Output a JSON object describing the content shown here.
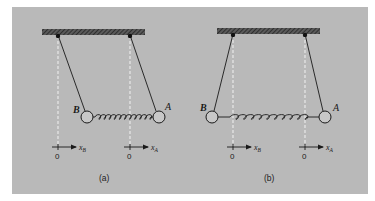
{
  "figure": {
    "background": "#b9b9b9",
    "ink": "#1a1a1a",
    "guide_color": "#f2f2f2",
    "panels": [
      {
        "id": "a",
        "caption": "(a)",
        "state": "spring compressed, masses displaced right",
        "mass_left_label": "B",
        "mass_right_label": "A",
        "axis_left": {
          "origin_label": "0",
          "var_label": "x",
          "sub": "B"
        },
        "axis_right": {
          "origin_label": "0",
          "var_label": "x",
          "sub": "A"
        }
      },
      {
        "id": "b",
        "caption": "(b)",
        "state": "spring stretched, masses displaced outward",
        "mass_left_label": "B",
        "mass_right_label": "A",
        "axis_left": {
          "origin_label": "0",
          "var_label": "x",
          "sub": "B"
        },
        "axis_right": {
          "origin_label": "0",
          "var_label": "x",
          "sub": "A"
        }
      }
    ]
  }
}
